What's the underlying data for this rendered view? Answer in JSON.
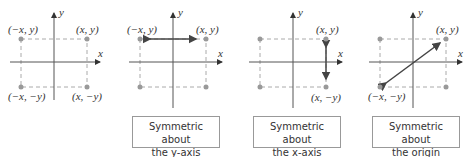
{
  "panels": [
    {
      "points": {
        "tl": "(−x, y)",
        "tr": "(x, y)",
        "bl": "(−x, −y)",
        "br": "(x, −y)"
      }
    },
    {
      "points": {
        "tl": "(−x, y)",
        "tr": "(x, y)"
      },
      "caption": {
        "line1": "Symmetric about",
        "line2": "the y-axis"
      }
    },
    {
      "points": {
        "tr": "(x, y)",
        "br": "(x, −y)"
      },
      "caption": {
        "line1": "Symmetric about",
        "line2": "the x-axis"
      }
    },
    {
      "points": {
        "tr": "(x, y)",
        "bl": "(−x, −y)"
      },
      "caption": {
        "line1": "Symmetric about",
        "line2": "the origin"
      }
    }
  ],
  "axes": {
    "x": "x",
    "y": "y"
  },
  "colors": {
    "axis": "#555555",
    "dash": "#aaaaaa",
    "point": "#999999",
    "arrow": "#444444"
  }
}
